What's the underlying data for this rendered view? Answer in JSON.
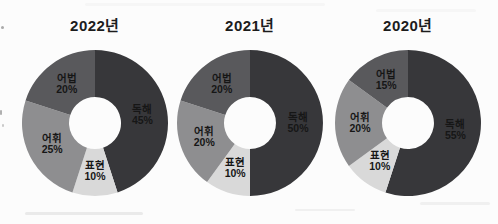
{
  "style": {
    "background": "#fcfcfc",
    "title_color": "#1c1c1c",
    "label_color": "#161616"
  },
  "chart_data": [
    {
      "type": "pie",
      "subtype": "donut",
      "title": "2022년",
      "categories": [
        "독해",
        "표현",
        "어휘",
        "어법"
      ],
      "values": [
        45,
        10,
        25,
        20
      ],
      "unit": "%",
      "colors": [
        "#37373a",
        "#d9d9d9",
        "#8e8e90",
        "#59595c"
      ],
      "start_angle_deg": 0,
      "direction": "clockwise",
      "inner_radius_ratio": 0.356,
      "legend": "none",
      "labels_inside": true
    },
    {
      "type": "pie",
      "subtype": "donut",
      "title": "2021년",
      "categories": [
        "독해",
        "표현",
        "어휘",
        "어법"
      ],
      "values": [
        50,
        10,
        20,
        20
      ],
      "unit": "%",
      "colors": [
        "#37373a",
        "#d9d9d9",
        "#8e8e90",
        "#59595c"
      ],
      "start_angle_deg": 0,
      "direction": "clockwise",
      "inner_radius_ratio": 0.356,
      "legend": "none",
      "labels_inside": true
    },
    {
      "type": "pie",
      "subtype": "donut",
      "title": "2020년",
      "categories": [
        "독해",
        "표현",
        "어휘",
        "어법"
      ],
      "values": [
        55,
        10,
        20,
        15
      ],
      "unit": "%",
      "colors": [
        "#37373a",
        "#d9d9d9",
        "#8e8e90",
        "#59595c"
      ],
      "start_angle_deg": 0,
      "direction": "clockwise",
      "inner_radius_ratio": 0.356,
      "legend": "none",
      "labels_inside": true
    }
  ]
}
